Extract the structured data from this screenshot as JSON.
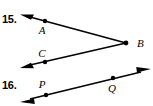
{
  "page": {
    "width": 153,
    "height": 106,
    "background_color": "#ffffff",
    "ink_color": "#000000"
  },
  "problems": [
    {
      "number_label": "15.",
      "figure_type": "angle-two-rays",
      "description": "Angle formed by two rays sharing vertex B, opening to the left",
      "vertex": {
        "label": "B",
        "x": 126,
        "y": 43,
        "label_x": 137,
        "label_y": 47
      },
      "points": [
        {
          "label": "A",
          "x": 45,
          "y": 21,
          "label_x": 42,
          "label_y": 34
        },
        {
          "label": "C",
          "x": 45,
          "y": 62,
          "label_x": 42,
          "label_y": 57
        }
      ],
      "rays": [
        {
          "name": "ray-BA",
          "from_x": 126,
          "from_y": 43,
          "to_x": 22,
          "to_y": 15,
          "arrow_at": "end"
        },
        {
          "name": "ray-BC",
          "from_x": 126,
          "from_y": 43,
          "to_x": 22,
          "to_y": 67,
          "arrow_at": "end"
        }
      ]
    },
    {
      "number_label": "16.",
      "figure_type": "line-two-points",
      "description": "Line with arrowheads at both ends through points P and Q",
      "points": [
        {
          "label": "P",
          "x": 46,
          "y": 95,
          "label_x": 40,
          "label_y": 88
        },
        {
          "label": "Q",
          "x": 113,
          "y": 78,
          "label_x": 110,
          "label_y": 92
        }
      ],
      "lines": [
        {
          "name": "line-PQ",
          "from_x": 22,
          "from_y": 101,
          "to_x": 149,
          "to_y": 70,
          "arrow_at": "both"
        }
      ]
    }
  ]
}
